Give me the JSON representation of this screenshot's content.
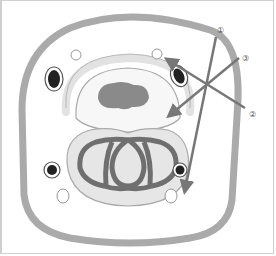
{
  "diagram": {
    "type": "biological cross-section (embryo / cell diagram)",
    "colors": {
      "outer_wall": "#aaaaaa",
      "inner_fill": "#ffffff",
      "dark_structure": "#6f6f6f",
      "light_fill": "#e6e6e6",
      "arrow": "#777777",
      "label_text": "#555555"
    },
    "labels": [
      {
        "id": "1",
        "text": "①"
      },
      {
        "id": "2",
        "text": "②"
      },
      {
        "id": "3",
        "text": "③"
      }
    ]
  }
}
